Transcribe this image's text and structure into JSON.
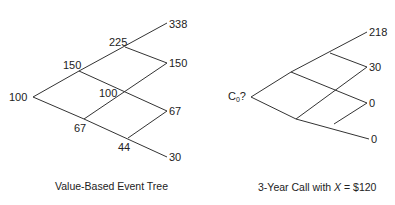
{
  "left_tree": {
    "caption": "Value-Based Event Tree",
    "nodes": {
      "root": "100",
      "u": "150",
      "d": "67",
      "uu": "225",
      "ud": "100",
      "dd": "44",
      "uuu": "338",
      "uud": "150",
      "udd": "67",
      "ddd": "30"
    }
  },
  "right_tree": {
    "caption_prefix": "3-Year Call with ",
    "caption_var": "X",
    "caption_suffix": " = $120",
    "nodes": {
      "root_main": "C",
      "root_sub": "0",
      "root_q": "?",
      "uuu": "218",
      "uud": "30",
      "udd": "0",
      "ddd": "0"
    }
  }
}
